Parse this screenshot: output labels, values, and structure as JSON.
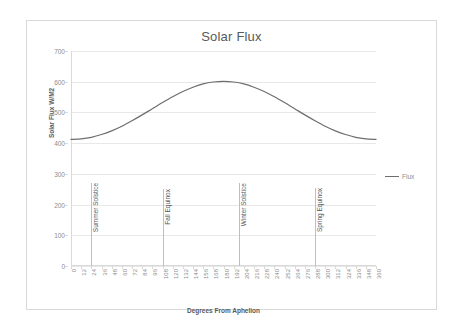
{
  "chart_data": {
    "type": "line",
    "title": "Solar Flux",
    "xlabel": "Degrees From Aphelion",
    "ylabel": "Solar Flux W/M2",
    "xlim": [
      0,
      360
    ],
    "ylim": [
      0,
      700
    ],
    "grid": true,
    "legend_position": "right",
    "y_ticks": [
      0,
      100,
      200,
      300,
      400,
      500,
      600,
      700
    ],
    "x_ticks": [
      0,
      12,
      24,
      36,
      48,
      60,
      72,
      84,
      96,
      108,
      120,
      132,
      144,
      156,
      168,
      180,
      192,
      204,
      216,
      228,
      240,
      252,
      264,
      276,
      288,
      300,
      312,
      324,
      336,
      348,
      360
    ],
    "series": [
      {
        "name": "Flux",
        "color": "#6e6e6e",
        "x": [
          0,
          12,
          24,
          36,
          48,
          60,
          72,
          84,
          96,
          108,
          120,
          132,
          144,
          156,
          168,
          180,
          192,
          204,
          216,
          228,
          240,
          252,
          264,
          276,
          288,
          300,
          312,
          324,
          336,
          348,
          360
        ],
        "values": [
          412,
          414,
          419,
          428,
          440,
          455,
          473,
          492,
          512,
          532,
          551,
          568,
          582,
          593,
          599,
          601,
          599,
          593,
          582,
          568,
          551,
          532,
          512,
          492,
          473,
          455,
          440,
          428,
          419,
          414,
          412
        ]
      }
    ],
    "annotations": [
      {
        "label": "Summer Solstice",
        "x": 24,
        "y_top": 270
      },
      {
        "label": "Fall Equinox",
        "x": 108,
        "y_top": 250
      },
      {
        "label": "Winter Solstice",
        "x": 198,
        "y_top": 270
      },
      {
        "label": "Spring Equinox",
        "x": 288,
        "y_top": 255
      }
    ]
  },
  "legend": {
    "items": [
      {
        "label": "Flux",
        "color": "#6e6e6e"
      }
    ]
  }
}
